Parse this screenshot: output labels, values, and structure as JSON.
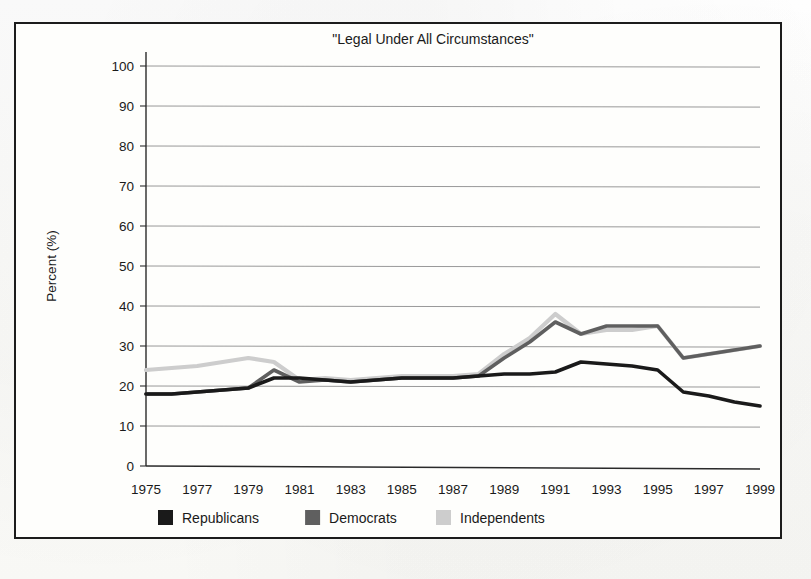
{
  "figure": {
    "title": "\"Legal Under All Circumstances\"",
    "y_axis_title": "Percent (%)",
    "x_tick_labels": [
      "1975",
      "1977",
      "1979",
      "1981",
      "1983",
      "1985",
      "1987",
      "1989",
      "1991",
      "1993",
      "1995",
      "1997",
      "1999"
    ],
    "y_tick_labels": [
      "0",
      "10",
      "20",
      "30",
      "40",
      "50",
      "60",
      "70",
      "80",
      "90",
      "100"
    ],
    "legend": [
      {
        "label": "Republicans",
        "color": "#1a1a1a"
      },
      {
        "label": "Democrats",
        "color": "#5f5f5f"
      },
      {
        "label": "Independents",
        "color": "#cdcdcd"
      }
    ]
  },
  "chart_data": {
    "type": "line",
    "title": "\"Legal Under All Circumstances\"",
    "xlabel": "",
    "ylabel": "Percent (%)",
    "xlim": [
      1975,
      1999
    ],
    "ylim": [
      0,
      100
    ],
    "ytick_step": 10,
    "grid": true,
    "legend_position": "below-axis-left",
    "x": [
      1975,
      1976,
      1977,
      1978,
      1979,
      1980,
      1981,
      1982,
      1983,
      1984,
      1985,
      1986,
      1987,
      1988,
      1989,
      1990,
      1991,
      1992,
      1993,
      1994,
      1995,
      1996,
      1997,
      1998,
      1999
    ],
    "series": [
      {
        "name": "Republicans",
        "color": "#1a1a1a",
        "values": [
          18,
          18,
          18.5,
          19,
          19.5,
          22,
          22,
          21.5,
          21,
          21.5,
          22,
          22,
          22,
          22.5,
          23,
          23,
          23.5,
          26,
          25.5,
          25,
          24,
          18.5,
          17.5,
          16,
          15
        ]
      },
      {
        "name": "Democrats",
        "color": "#5f5f5f",
        "values": [
          18,
          18,
          18.5,
          19,
          19.5,
          24,
          21,
          21.5,
          21,
          21.5,
          22,
          22,
          22,
          22.5,
          27,
          31,
          36,
          33,
          35,
          35,
          35,
          27,
          28,
          29,
          30
        ]
      },
      {
        "name": "Independents",
        "color": "#cdcdcd",
        "values": [
          24,
          24.5,
          25,
          26,
          27,
          26,
          21.5,
          22,
          21.5,
          22,
          22.5,
          22.5,
          22.5,
          23,
          28,
          32,
          38,
          33,
          34,
          34,
          35,
          27,
          28,
          29,
          30
        ]
      }
    ]
  }
}
